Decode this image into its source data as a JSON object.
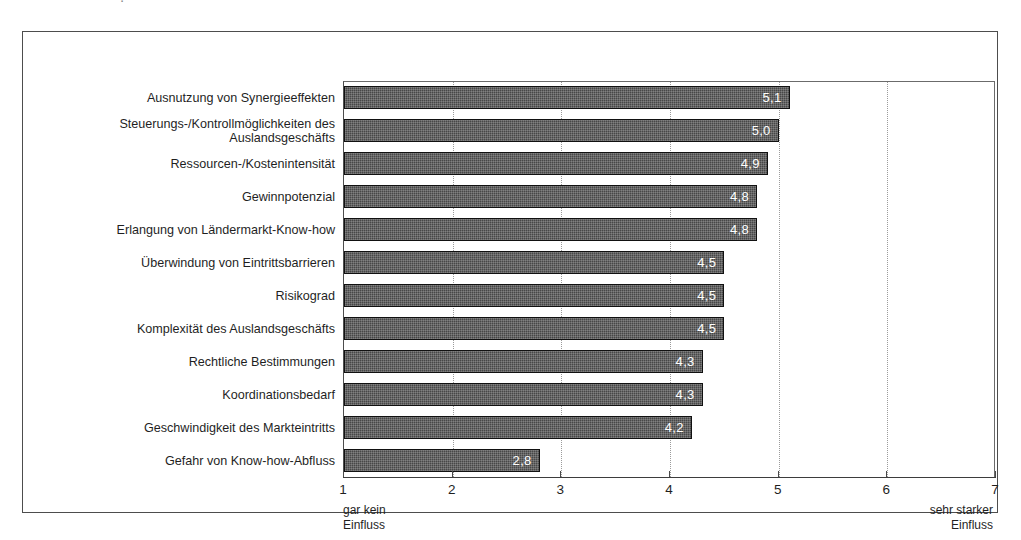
{
  "scan": {
    "top_clipped_text": "."
  },
  "chart_data": {
    "type": "bar",
    "orientation": "horizontal",
    "title": "",
    "xlabel": "",
    "ylabel": "",
    "xlim": [
      1,
      7
    ],
    "grid": true,
    "gridlines": "vertical dotted at integer ticks 2-6",
    "legend": "none",
    "value_label_format": "one decimal, comma decimal separator",
    "tick_labels": [
      "1",
      "2",
      "3",
      "4",
      "5",
      "6",
      "7"
    ],
    "ticks": [
      1,
      2,
      3,
      4,
      5,
      6,
      7
    ],
    "axis_anchor_low": "gar kein\nEinfluss",
    "axis_anchor_high": "sehr starker\nEinfluss",
    "categories": [
      "Ausnutzung von Synergieeffekten",
      "Steuerungs-/Kontrollmöglichkeiten des\nAuslandsgeschäfts",
      "Ressourcen-/Kostenintensität",
      "Gewinnpotenzial",
      "Erlangung von Ländermarkt-Know-how",
      "Überwindung von Eintrittsbarrieren",
      "Risikograd",
      "Komplexität des Auslandsgeschäfts",
      "Rechtliche Bestimmungen",
      "Koordinationsbedarf",
      "Geschwindigkeit des Markteintritts",
      "Gefahr von Know-how-Abfluss"
    ],
    "values": [
      5.1,
      5.0,
      4.9,
      4.8,
      4.8,
      4.5,
      4.5,
      4.5,
      4.3,
      4.3,
      4.2,
      2.8
    ],
    "value_labels": [
      "5,1",
      "5,0",
      "4,9",
      "4,8",
      "4,8",
      "4,5",
      "4,5",
      "4,5",
      "4,3",
      "4,3",
      "4,2",
      "2,8"
    ],
    "bar_color": "#474747",
    "bar_border_color": "#111111",
    "value_label_color": "#ffffff"
  }
}
